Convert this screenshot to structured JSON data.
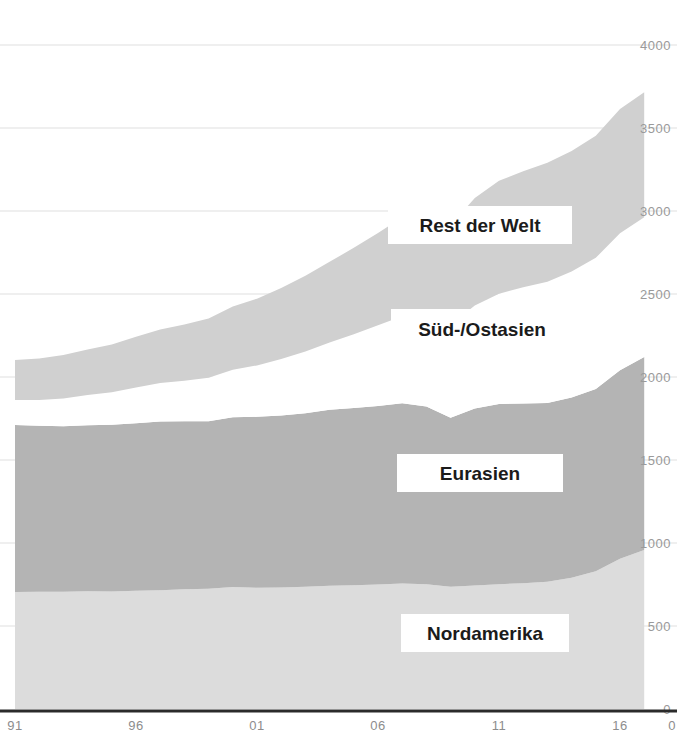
{
  "chart_data": {
    "type": "area",
    "stacked": true,
    "title": "",
    "subtitle": "",
    "xlabel": "",
    "ylabel": "",
    "xlim": [
      91,
      17.2
    ],
    "ylim": [
      0,
      4000
    ],
    "grid": true,
    "legend_position": "inline-labels",
    "y_ticks": [
      0,
      500,
      1000,
      1500,
      2000,
      2500,
      3000,
      3500,
      4000
    ],
    "y_tick_labels": [
      "0",
      "500",
      "1000",
      "1500",
      "2000",
      "2500",
      "3000",
      "3500",
      "4000"
    ],
    "x_ticks": [
      91,
      96,
      101,
      106,
      111,
      116
    ],
    "x_tick_labels": [
      "91",
      "96",
      "01",
      "06",
      "11",
      "16"
    ],
    "x": [
      91,
      92,
      93,
      94,
      95,
      96,
      97,
      98,
      99,
      100,
      101,
      102,
      103,
      104,
      105,
      106,
      107,
      108,
      109,
      110,
      111,
      112,
      113,
      114,
      115,
      116,
      117
    ],
    "series": [
      {
        "name": "Nordamerika",
        "color": "#dcdcdc",
        "values": [
          705,
          706,
          707,
          710,
          708,
          712,
          716,
          722,
          724,
          735,
          730,
          732,
          736,
          742,
          746,
          750,
          756,
          752,
          736,
          744,
          752,
          758,
          766,
          790,
          830,
          905,
          958
        ]
      },
      {
        "name": "Eurasien",
        "color": "#b4b4b4",
        "values": [
          1006,
          1000,
          996,
          1000,
          1004,
          1010,
          1016,
          1012,
          1010,
          1022,
          1030,
          1036,
          1046,
          1060,
          1068,
          1076,
          1086,
          1070,
          1018,
          1066,
          1086,
          1082,
          1078,
          1086,
          1098,
          1136,
          1162
        ]
      },
      {
        "name": "Süd-/Ostasien",
        "color": "#ffffff",
        "values": [
          150,
          156,
          168,
          182,
          196,
          214,
          232,
          244,
          262,
          286,
          310,
          340,
          372,
          406,
          444,
          486,
          524,
          552,
          560,
          620,
          664,
          700,
          730,
          760,
          790,
          825,
          843
        ]
      },
      {
        "name": "Rest der Welt",
        "color": "#d0d0d0",
        "values": [
          241,
          250,
          262,
          274,
          288,
          306,
          322,
          338,
          356,
          382,
          402,
          428,
          456,
          486,
          520,
          556,
          596,
          628,
          600,
          648,
          680,
          700,
          716,
          726,
          736,
          748,
          753
        ]
      }
    ],
    "totals_note": "",
    "annotations": []
  },
  "labels": {
    "rest_der_welt": "Rest der Welt",
    "sued_ostasien": "Süd-/Ostasien",
    "eurasien": "Eurasien",
    "nordamerika": "Nordamerika"
  },
  "axis_right_extra_label": "0"
}
